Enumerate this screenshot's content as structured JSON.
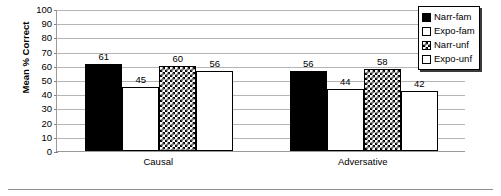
{
  "chart_data": {
    "type": "bar",
    "title": "",
    "subtitle": "",
    "xlabel": "",
    "ylabel": "Mean % Correct",
    "categories": [
      "Causal",
      "Adversative"
    ],
    "series": [
      {
        "name": "Narr-fam",
        "values": [
          61,
          56
        ],
        "pattern": "solid-black"
      },
      {
        "name": "Expo-fam",
        "values": [
          45,
          44
        ],
        "pattern": "white"
      },
      {
        "name": "Narr-unf",
        "values": [
          60,
          58
        ],
        "pattern": "checkerboard"
      },
      {
        "name": "Expo-unf",
        "values": [
          56,
          42
        ],
        "pattern": "light-dots"
      }
    ],
    "ylim": [
      0,
      100
    ],
    "ytick_step": 10,
    "yticks": [
      100,
      90,
      80,
      70,
      60,
      50,
      40,
      30,
      20,
      10,
      0
    ],
    "grid": "horizontal",
    "legend_position": "top-right",
    "data_labels": true,
    "colors": {
      "axis": "#9a9a9a",
      "gridline": "#b5b5b5",
      "bar_outline": "#000000",
      "bar_solid": "#000000",
      "bar_white": "#ffffff",
      "text": "#000000",
      "background": "#ffffff"
    }
  }
}
